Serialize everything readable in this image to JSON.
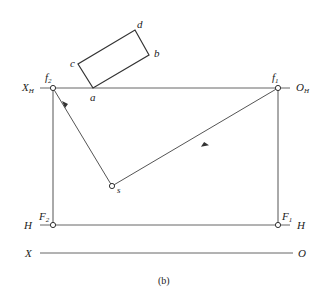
{
  "figure": {
    "caption": "(b)",
    "labels": {
      "XH": {
        "main": "X",
        "sub": "H"
      },
      "OH": {
        "main": "O",
        "sub": "H"
      },
      "f2": {
        "main": "f",
        "sub": "2"
      },
      "f1": {
        "main": "f",
        "sub": "1"
      },
      "a": "a",
      "b": "b",
      "c": "c",
      "d": "d",
      "s": "s",
      "F2": {
        "main": "F",
        "sub": "2"
      },
      "F1": {
        "main": "F",
        "sub": "1"
      },
      "H_left": "H",
      "H_right": "H",
      "X": "X",
      "O": "O"
    },
    "colors": {
      "line": "#555555",
      "text": "#222222"
    }
  }
}
